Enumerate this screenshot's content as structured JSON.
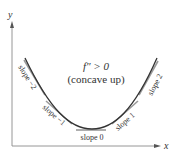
{
  "diagram": {
    "title_line1": "f″ > 0",
    "title_line2": "(concave up)",
    "axes": {
      "x_label": "x",
      "y_label": "y"
    },
    "tangents": [
      {
        "label": "slope −2"
      },
      {
        "label": "slope −1"
      },
      {
        "label": "slope 0"
      },
      {
        "label": "slope 1"
      },
      {
        "label": "slope 2"
      }
    ],
    "colors": {
      "curve": "#333333",
      "tangent": "#999999",
      "axis": "#888888",
      "text": "#333333"
    }
  }
}
